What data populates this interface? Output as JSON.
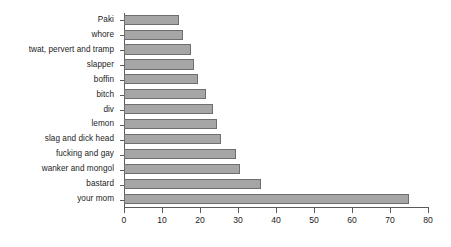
{
  "chart_data": {
    "type": "bar",
    "orientation": "horizontal",
    "title": "",
    "subtitle": "",
    "xlabel": "",
    "ylabel": "",
    "xlim": [
      0,
      80
    ],
    "xticks": [
      0,
      10,
      20,
      30,
      40,
      50,
      60,
      70,
      80
    ],
    "xtick_labels": [
      "0",
      "10",
      "20",
      "30",
      "40",
      "50",
      "60",
      "70",
      "80"
    ],
    "grid": false,
    "legend": false,
    "legend_position": "none",
    "bar_fill_color": "#a6a6a6",
    "bar_edge_color": "#6e6e6e",
    "axis_color": "#5a5a5a",
    "background_color": "#ffffff",
    "categories": [
      "Paki",
      "whore",
      "twat, pervert and tramp",
      "slapper",
      "boffin",
      "bitch",
      "div",
      "lemon",
      "slag and dick head",
      "fucking and gay",
      "wanker and mongol",
      "bastard",
      "your mom"
    ],
    "values": [
      14.5,
      15.5,
      17.5,
      18.5,
      19.5,
      21.5,
      23.5,
      24.5,
      25.5,
      29.5,
      30.5,
      36,
      75
    ]
  }
}
